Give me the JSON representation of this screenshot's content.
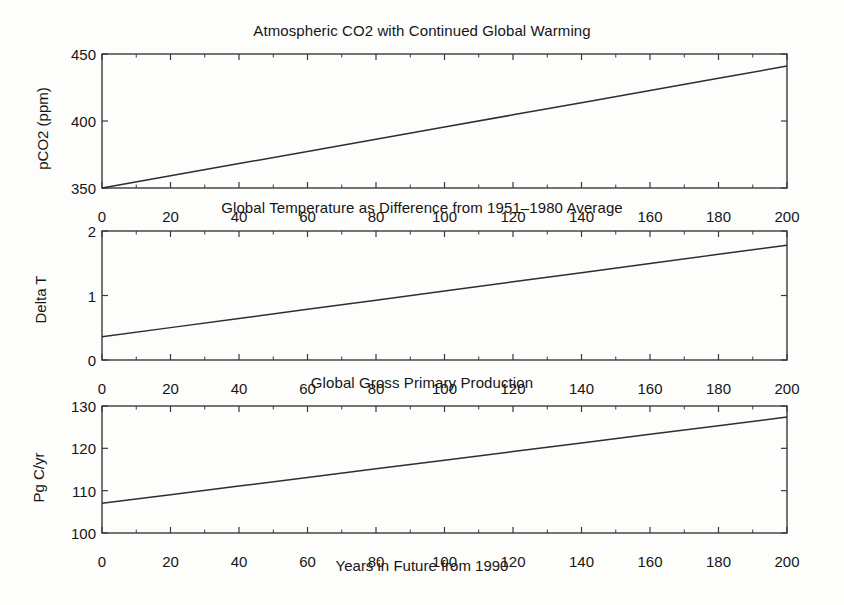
{
  "figure": {
    "main_title": "Atmospheric CO2 with Continued Global Warming",
    "xaxis_label": "Years in Future from 1990"
  },
  "panels": [
    {
      "title": "Atmospheric CO2 with Continued Global Warming",
      "ylabel": "pCO2 (ppm)",
      "yticks": [
        "350",
        "400",
        "450"
      ],
      "xticks": [
        "0",
        "20",
        "40",
        "60",
        "80",
        "100",
        "120",
        "140",
        "160",
        "180",
        "200"
      ]
    },
    {
      "title": "Global Temperature as Difference from 1951–1980 Average",
      "ylabel": "Delta T",
      "yticks": [
        "0",
        "1",
        "2"
      ],
      "xticks": [
        "0",
        "20",
        "40",
        "60",
        "80",
        "100",
        "120",
        "140",
        "160",
        "180",
        "200"
      ]
    },
    {
      "title": "Global Gross Primary Production",
      "ylabel": "Pg C/yr",
      "yticks": [
        "100",
        "110",
        "120",
        "130"
      ],
      "xticks": [
        "0",
        "20",
        "40",
        "60",
        "80",
        "100",
        "120",
        "140",
        "160",
        "180",
        "200"
      ]
    }
  ],
  "chart_data": [
    {
      "type": "line",
      "title": "Atmospheric CO2 with Continued Global Warming",
      "xlabel": "Years in Future from 1990",
      "ylabel": "pCO2 (ppm)",
      "xlim": [
        0,
        200
      ],
      "ylim": [
        350,
        450
      ],
      "xticks": [
        0,
        20,
        40,
        60,
        80,
        100,
        120,
        140,
        160,
        180,
        200
      ],
      "yticks": [
        350,
        400,
        450
      ],
      "grid": false,
      "legend": null,
      "x": [
        0,
        20,
        40,
        60,
        80,
        100,
        120,
        140,
        160,
        180,
        200
      ],
      "values": [
        350.0,
        359.1,
        368.2,
        377.3,
        386.4,
        395.5,
        404.6,
        413.7,
        422.8,
        431.9,
        441.0
      ]
    },
    {
      "type": "line",
      "title": "Global Temperature as Difference from 1951–1980 Average",
      "xlabel": "Years in Future from 1990",
      "ylabel": "Delta T",
      "xlim": [
        0,
        200
      ],
      "ylim": [
        0,
        2
      ],
      "xticks": [
        0,
        20,
        40,
        60,
        80,
        100,
        120,
        140,
        160,
        180,
        200
      ],
      "yticks": [
        0,
        1,
        2
      ],
      "grid": false,
      "legend": null,
      "x": [
        0,
        20,
        40,
        60,
        80,
        100,
        120,
        140,
        160,
        180,
        200
      ],
      "values": [
        0.36,
        0.502,
        0.644,
        0.786,
        0.928,
        1.07,
        1.212,
        1.354,
        1.496,
        1.638,
        1.78
      ]
    },
    {
      "type": "line",
      "title": "Global Gross Primary Production",
      "xlabel": "Years in Future from 1990",
      "ylabel": "Pg C/yr",
      "xlim": [
        0,
        200
      ],
      "ylim": [
        100,
        130
      ],
      "xticks": [
        0,
        20,
        40,
        60,
        80,
        100,
        120,
        140,
        160,
        180,
        200
      ],
      "yticks": [
        100,
        110,
        120,
        130
      ],
      "grid": false,
      "legend": null,
      "x": [
        0,
        20,
        40,
        60,
        80,
        100,
        120,
        140,
        160,
        180,
        200
      ],
      "values": [
        107.0,
        109.04,
        111.08,
        113.12,
        115.16,
        117.2,
        119.24,
        121.28,
        123.32,
        125.36,
        127.4
      ]
    }
  ]
}
